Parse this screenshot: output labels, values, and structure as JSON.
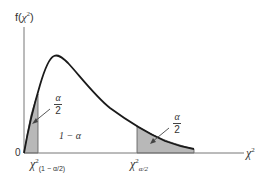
{
  "diagram": {
    "y_axis_label": {
      "fn": "f(",
      "var": "χ",
      "sup": "2",
      "close": ")"
    },
    "x_axis_label": {
      "var": "χ",
      "sup": "2"
    },
    "origin_label": "0",
    "center_region_label": "1 − α",
    "left_tail": {
      "numerator": "α",
      "denominator": "2"
    },
    "right_tail": {
      "numerator": "α",
      "denominator": "2"
    },
    "lower_critical": {
      "var": "χ",
      "sup": "2",
      "sub": "(1 − α/2)"
    },
    "upper_critical": {
      "var": "χ",
      "sup": "2",
      "sub": "α/2"
    },
    "colors": {
      "curve": "#1a1a1a",
      "axis": "#777777",
      "shade": "#b8b8b8",
      "text": "#333333"
    }
  }
}
